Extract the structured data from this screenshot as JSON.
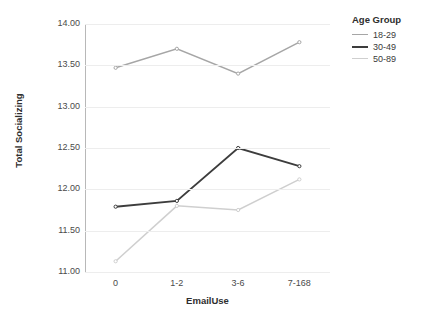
{
  "chart_data": {
    "type": "line",
    "title": "",
    "xlabel": "EmailUse",
    "ylabel": "Total Socializing",
    "categories": [
      "0",
      "1-2",
      "3-6",
      "7-168"
    ],
    "ylim": [
      11.0,
      14.0
    ],
    "ytick_labels": [
      "11.00",
      "11.50",
      "12.00",
      "12.50",
      "13.00",
      "13.50",
      "14.00"
    ],
    "ytick_values": [
      11.0,
      11.5,
      12.0,
      12.5,
      13.0,
      13.5,
      14.0
    ],
    "grid": true,
    "legend_position": "right",
    "legend_title": "Age Group",
    "series": [
      {
        "name": "18-29",
        "values": [
          13.47,
          13.7,
          13.4,
          13.78
        ],
        "color": "#a6a6a6"
      },
      {
        "name": "30-49",
        "values": [
          11.79,
          11.86,
          12.5,
          12.28
        ],
        "color": "#3d3d3d"
      },
      {
        "name": "50-89",
        "values": [
          11.13,
          11.8,
          11.75,
          12.12
        ],
        "color": "#cfcfcf"
      }
    ]
  },
  "axes": {
    "x_title": "EmailUse",
    "y_title": "Total Socializing"
  },
  "legend": {
    "title": "Age Group",
    "items": [
      {
        "label": "18-29"
      },
      {
        "label": "30-49"
      },
      {
        "label": "50-89"
      }
    ]
  }
}
